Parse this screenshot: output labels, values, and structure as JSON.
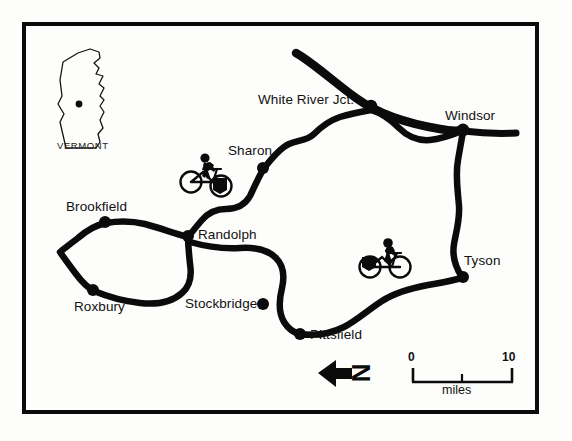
{
  "figure": {
    "kind": "reference-map",
    "region": "Vermont",
    "background_color": "#fdfdfb",
    "ink_color": "#0b0b0b",
    "frame": {
      "stroke_color": "#0b0b0b",
      "stroke_width": 4
    }
  },
  "inset": {
    "caption": "VERMONT",
    "state_outline_color": "#111111",
    "locator_dot_color": "#0b0b0b"
  },
  "places": [
    {
      "name": "White River Jct.",
      "dot": {
        "x": 371,
        "y": 106
      },
      "label": {
        "x": 258,
        "y": 92
      }
    },
    {
      "name": "Windsor",
      "dot": {
        "x": 463,
        "y": 130
      },
      "label": {
        "x": 445,
        "y": 108
      }
    },
    {
      "name": "Sharon",
      "dot": {
        "x": 263,
        "y": 168
      },
      "label": {
        "x": 228,
        "y": 143
      }
    },
    {
      "name": "Brookfield",
      "dot": {
        "x": 105,
        "y": 222
      },
      "label": {
        "x": 66,
        "y": 199
      }
    },
    {
      "name": "Randolph",
      "dot": {
        "x": 188,
        "y": 236
      },
      "label": {
        "x": 198,
        "y": 227
      }
    },
    {
      "name": "Roxbury",
      "dot": {
        "x": 93,
        "y": 290
      },
      "label": {
        "x": 74,
        "y": 299
      }
    },
    {
      "name": "Stockbridge",
      "dot": {
        "x": 263,
        "y": 304
      },
      "label": {
        "x": 185,
        "y": 296
      }
    },
    {
      "name": "Pittsfield",
      "dot": {
        "x": 300,
        "y": 334
      },
      "label": {
        "x": 310,
        "y": 327
      }
    },
    {
      "name": "Tyson",
      "dot": {
        "x": 463,
        "y": 277
      },
      "label": {
        "x": 464,
        "y": 253
      }
    }
  ],
  "cyclists": [
    {
      "id": "cyclist-west",
      "x": 183,
      "y": 160,
      "facing": "right"
    },
    {
      "id": "cyclist-east",
      "x": 362,
      "y": 245,
      "facing": "right"
    }
  ],
  "north_arrow": {
    "letter": "N",
    "arrow_direction": "left",
    "letter_rotation_deg": 90,
    "x": 318,
    "y": 358
  },
  "scale_bar": {
    "min_label": "0",
    "max_label": "10",
    "unit_label": "miles",
    "x_start": 412,
    "x_end": 513,
    "y": 382,
    "tick_mid_x": 462
  },
  "icons": {
    "bicycle": "bicycle-icon",
    "north_arrow": "north-arrow-icon",
    "state_outline": "vermont-outline-icon",
    "city_dot": "city-dot-icon"
  }
}
